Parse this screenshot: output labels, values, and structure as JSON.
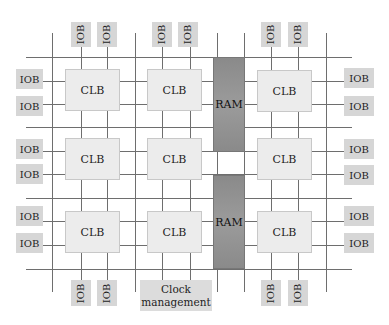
{
  "diagram": {
    "labels": {
      "iob": "IOB",
      "clb": "CLB",
      "ram": "RAM",
      "clock_line1": "Clock",
      "clock_line2": "management"
    },
    "colors": {
      "iob": "#d6d6d6",
      "clb": "#ececec",
      "ram": "#8f8f8f",
      "clock": "#dcdcdc",
      "wire": "#6e6e6e"
    },
    "clb_grid": {
      "rows": 3,
      "columns": 3,
      "cells": [
        "CLB",
        "CLB",
        "CLB",
        "CLB",
        "CLB",
        "CLB",
        "CLB",
        "CLB",
        "CLB"
      ]
    },
    "ram_blocks": [
      "RAM",
      "RAM"
    ],
    "iob_counts": {
      "top": 6,
      "bottom": 4,
      "left": 6,
      "right": 6
    }
  }
}
